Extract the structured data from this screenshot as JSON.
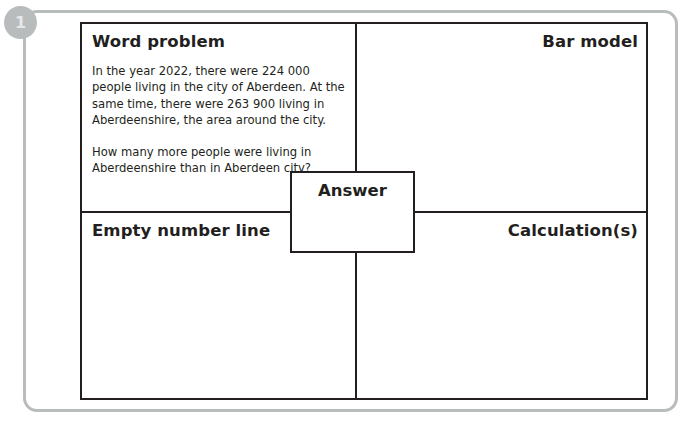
{
  "step": {
    "badge_number": "1"
  },
  "worksheet": {
    "cells": {
      "word_problem": {
        "heading": "Word problem",
        "paragraphs": [
          "In the year 2022, there were 224 000 people living in the city of Aberdeen. At the same time, there were 263 900 living in Aberdeenshire, the area around the city.",
          "How many more people were living in Aberdeenshire than in Aberdeen city?"
        ]
      },
      "bar_model": {
        "heading": "Bar model"
      },
      "empty_number_line": {
        "heading": "Empty number line"
      },
      "calculations": {
        "heading": "Calculation(s)"
      }
    },
    "answer": {
      "label": "Answer"
    }
  },
  "colors": {
    "ink": "#231f20",
    "frame_grey": "#b9bcbd",
    "badge_text": "#e6e7e8",
    "paper": "#ffffff"
  }
}
